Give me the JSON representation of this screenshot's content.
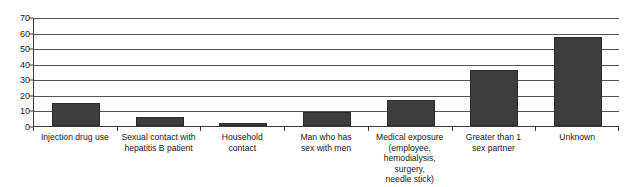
{
  "chart_data": {
    "type": "bar",
    "title": "",
    "subtitle": "",
    "xlabel": "",
    "ylabel": "",
    "ylim": [
      0,
      70
    ],
    "ytick_step": 10,
    "yticks": [
      70,
      60,
      50,
      40,
      30,
      20,
      10,
      0
    ],
    "grid": true,
    "legend": "none",
    "bar_color": "#3d3d3d",
    "axis_color": "#3a3a3a",
    "gridline_color": "#555555",
    "categories": [
      "Injection drug use",
      "Sexual contact with hepatitis B patient",
      "Household contact",
      "Man who has sex with men",
      "Medical exposure (employee, hemodialysis, surgery, needle stick)",
      "Greater than 1 sex partner",
      "Unknown"
    ],
    "category_label_lines": [
      [
        "Injection drug use"
      ],
      [
        "Sexual contact with",
        "hepatitis B patient"
      ],
      [
        "Household",
        "contact"
      ],
      [
        "Man who has",
        "sex with men"
      ],
      [
        "Medical exposure",
        "(employee,",
        "hemodialysis, surgery,",
        "needle stick)"
      ],
      [
        "Greater than 1",
        "sex partner"
      ],
      [
        "Unknown"
      ]
    ],
    "values": [
      15,
      6,
      2,
      9,
      17,
      36,
      57
    ]
  }
}
